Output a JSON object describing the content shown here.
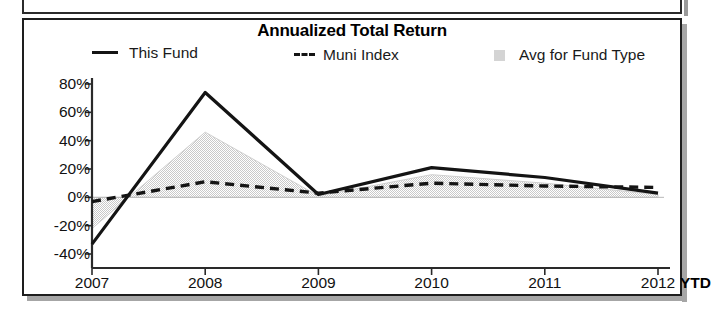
{
  "chart_panel": {
    "title": "Annualized Total Return"
  },
  "legend": {
    "items": [
      {
        "label": "This Fund",
        "marker": "solid-line-swatch"
      },
      {
        "label": "Muni Index",
        "marker": "dashed-line-swatch"
      },
      {
        "label": "Avg for Fund Type",
        "marker": "gray-box-swatch"
      }
    ]
  },
  "axes": {
    "y_ticks": [
      "80%",
      "60%",
      "40%",
      "20%",
      "0%",
      "-20%",
      "-40%"
    ],
    "x_ticks": [
      "2007",
      "2008",
      "2009",
      "2010",
      "2011",
      "2012"
    ],
    "x_suffix": "YTD"
  },
  "chart_data": {
    "type": "line",
    "title": "Annualized Total Return",
    "xlabel": "",
    "ylabel": "",
    "categories": [
      "2007",
      "2008",
      "2009",
      "2010",
      "2011",
      "2012"
    ],
    "x_axis_note": "2012 value is year-to-date (YTD)",
    "ylim": [
      -40,
      80
    ],
    "ytick_values": [
      80,
      60,
      40,
      20,
      0,
      -20,
      -40
    ],
    "ytick_labels": [
      "80%",
      "60%",
      "40%",
      "20%",
      "0%",
      "-20%",
      "-40%"
    ],
    "grid": false,
    "zero_line": true,
    "legend_position": "top",
    "series": [
      {
        "name": "This Fund",
        "style": "solid",
        "color": "#141414",
        "values": [
          -33,
          74,
          2,
          21,
          14,
          3
        ]
      },
      {
        "name": "Muni Index",
        "style": "dashed",
        "color": "#141414",
        "values": [
          -3,
          11,
          3,
          10,
          8,
          7
        ]
      },
      {
        "name": "Avg for Fund Type",
        "style": "filled-area",
        "color": "#d4d4d4",
        "values": [
          -22,
          46,
          1,
          16,
          10,
          2
        ]
      }
    ]
  }
}
